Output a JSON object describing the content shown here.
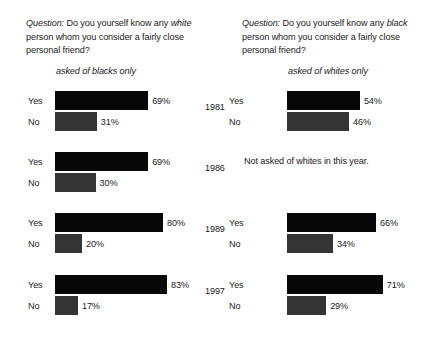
{
  "chart_data": {
    "type": "bar",
    "orientation": "horizontal",
    "xlabel": "",
    "ylabel": "",
    "xlim": [
      0,
      100
    ],
    "grid": false,
    "legend": null,
    "categories": [
      "Yes",
      "No"
    ],
    "value_suffix": "%",
    "panels": [
      {
        "question_label": "Question:",
        "question_part1": "Do you yourself know any",
        "question_emph": "white",
        "question_part2": "person whom you consider a fairly close personal friend?",
        "subtitle": "asked of blacks only",
        "groups": [
          {
            "year": "1981",
            "not_asked": false,
            "bars": [
              {
                "label": "Yes",
                "value": 69,
                "value_text": "69%"
              },
              {
                "label": "No",
                "value": 31,
                "value_text": "31%"
              }
            ]
          },
          {
            "year": "1986",
            "not_asked": false,
            "bars": [
              {
                "label": "Yes",
                "value": 69,
                "value_text": "69%"
              },
              {
                "label": "No",
                "value": 30,
                "value_text": "30%"
              }
            ]
          },
          {
            "year": "1989",
            "not_asked": false,
            "bars": [
              {
                "label": "Yes",
                "value": 80,
                "value_text": "80%"
              },
              {
                "label": "No",
                "value": 20,
                "value_text": "20%"
              }
            ]
          },
          {
            "year": "1997",
            "not_asked": false,
            "bars": [
              {
                "label": "Yes",
                "value": 83,
                "value_text": "83%"
              },
              {
                "label": "No",
                "value": 17,
                "value_text": "17%"
              }
            ]
          }
        ]
      },
      {
        "question_label": "Question:",
        "question_part1": "Do you yourself know any",
        "question_emph": "black",
        "question_part2": "person whom you consider a fairly close personal friend?",
        "subtitle": "asked of whites only",
        "groups": [
          {
            "year": "1981",
            "not_asked": false,
            "bars": [
              {
                "label": "Yes",
                "value": 54,
                "value_text": "54%"
              },
              {
                "label": "No",
                "value": 46,
                "value_text": "46%"
              }
            ]
          },
          {
            "year": "1986",
            "not_asked": true,
            "note": "Not asked of whites in this year.",
            "bars": []
          },
          {
            "year": "1989",
            "not_asked": false,
            "bars": [
              {
                "label": "Yes",
                "value": 66,
                "value_text": "66%"
              },
              {
                "label": "No",
                "value": 34,
                "value_text": "34%"
              }
            ]
          },
          {
            "year": "1997",
            "not_asked": false,
            "bars": [
              {
                "label": "Yes",
                "value": 71,
                "value_text": "71%"
              },
              {
                "label": "No",
                "value": 29,
                "value_text": "29%"
              }
            ]
          }
        ]
      }
    ],
    "colors": {
      "yes_bar": "#080808",
      "no_bar": "#343434",
      "text": "#1a1a1a",
      "background": "#ffffff"
    }
  }
}
